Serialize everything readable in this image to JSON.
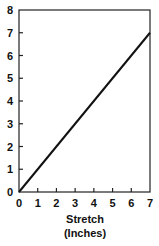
{
  "chart_data": {
    "type": "line",
    "title": "",
    "xlabel": "Stretch (Inches)",
    "xlabel_lines": [
      "Stretch",
      "(Inches)"
    ],
    "ylabel": "",
    "x": [
      0,
      7
    ],
    "series": [
      {
        "name": "stretch",
        "values": [
          0,
          7
        ]
      }
    ],
    "xlim": [
      0,
      7
    ],
    "ylim": [
      0,
      8
    ],
    "xticks": [
      "0",
      "1",
      "2",
      "3",
      "4",
      "5",
      "6",
      "7"
    ],
    "yticks": [
      "0",
      "1",
      "2",
      "3",
      "4",
      "5",
      "6",
      "7",
      "8"
    ],
    "grid": false,
    "legend": null,
    "line_color": "#111111"
  }
}
